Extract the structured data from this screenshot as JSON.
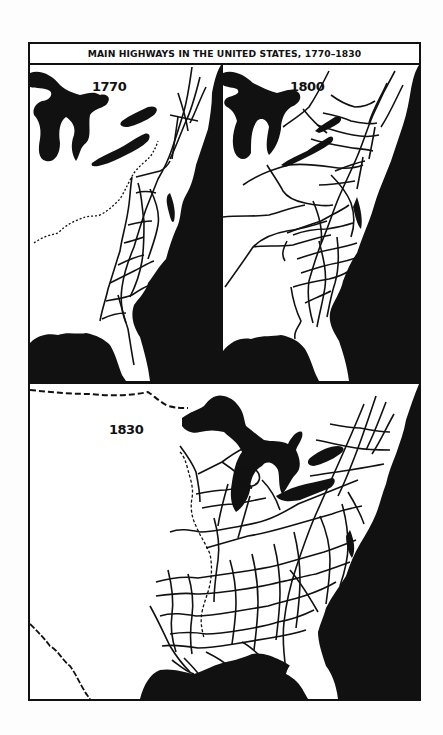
{
  "map": {
    "title": "MAIN HIGHWAYS IN THE UNITED STATES, 1770–1830",
    "panels": [
      {
        "year": "1770",
        "region": "Eastern seaboard, colonial roads"
      },
      {
        "year": "1800",
        "region": "Eastern states, expanded road network"
      },
      {
        "year": "1830",
        "region": "Eastern half of United States, dense road network"
      }
    ],
    "colors": {
      "land": "#ffffff",
      "water": "#111111",
      "roads": "#111111",
      "border": "#111111"
    },
    "legend_notes": {
      "solid_lines": "main highways",
      "dashed_lines": "boundaries",
      "dark_fill": "water (Great Lakes, Atlantic Ocean, Gulf of Mexico)"
    }
  }
}
